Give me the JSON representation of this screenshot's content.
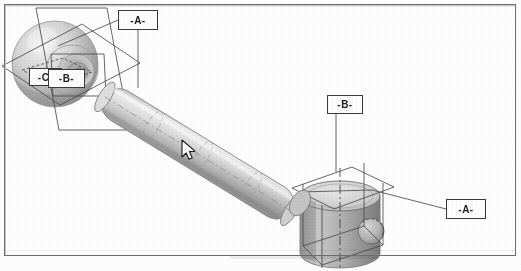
{
  "document": {
    "type": "scanned-cad-drawing",
    "title": "Isometric CAD assembly with datum reference planes",
    "background_color": "#ffffff",
    "border_color": "#6d6d6d"
  },
  "caption": {
    "text": ""
  },
  "annotations": {
    "datum_labels": [
      {
        "id": "datum-a-top",
        "text": "-A-",
        "x": 118,
        "y": 10,
        "w": 40,
        "h": 20
      },
      {
        "id": "datum-c",
        "text": "-C-",
        "x": 29,
        "y": 68,
        "w": 33,
        "h": 18
      },
      {
        "id": "datum-b-sphere",
        "text": "-B-",
        "x": 48,
        "y": 69,
        "w": 37,
        "h": 19
      },
      {
        "id": "datum-b-piston",
        "text": "-B-",
        "x": 327,
        "y": 95,
        "w": 36,
        "h": 19
      },
      {
        "id": "datum-a-right",
        "text": "-A-",
        "x": 446,
        "y": 199,
        "w": 40,
        "h": 20
      }
    ]
  },
  "geometry": {
    "parts": [
      {
        "name": "ball-joint-sphere",
        "shape": "sphere",
        "cx": 55,
        "cy": 65,
        "r": 42
      },
      {
        "name": "connecting-rod",
        "shape": "cylinder",
        "from": [
          118,
          92
        ],
        "to": [
          300,
          205
        ],
        "radius": 17
      },
      {
        "name": "piston-cylinder",
        "shape": "cylinder",
        "cx": 340,
        "cy": 215,
        "rx": 42,
        "h": 68
      },
      {
        "name": "piston-pin-hole",
        "shape": "circle",
        "cx": 372,
        "cy": 230,
        "r": 13
      }
    ],
    "datum_planes": [
      {
        "name": "plane-a",
        "attached_to": "sphere"
      },
      {
        "name": "plane-b",
        "attached_to": "sphere"
      },
      {
        "name": "plane-c",
        "attached_to": "sphere"
      },
      {
        "name": "plane-a-right",
        "attached_to": "piston"
      },
      {
        "name": "plane-b-right",
        "attached_to": "piston"
      }
    ]
  },
  "cursor": {
    "name": "mouse-pointer",
    "x": 185,
    "y": 145
  },
  "colors": {
    "line": "#3a3a3a",
    "metal_light": "#e4e4e4",
    "metal_mid": "#c2c2c2",
    "metal_dark": "#909090",
    "shadow": "#b4b4b4"
  }
}
